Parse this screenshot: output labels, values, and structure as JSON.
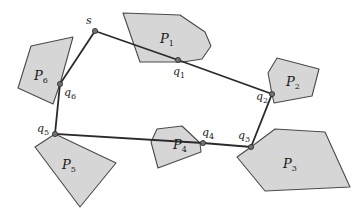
{
  "figure": {
    "colors": {
      "polygon_fill": "#d6d6d6",
      "polygon_stroke": "#4a4a4a",
      "path": "#2a2a2a",
      "point": "#707070"
    },
    "start": {
      "label": "s",
      "x": 95,
      "y": 31,
      "lx": 86,
      "ly": 24
    },
    "polygons": [
      {
        "name": "P",
        "sub": "1",
        "lx": 160,
        "ly": 43,
        "points": "123,13 180,15 205,32 211,46 202,59 183,62 140,62"
      },
      {
        "name": "P",
        "sub": "2",
        "lx": 286,
        "ly": 86,
        "points": "277,58 319,69 312,96 274,103 272,94 268,73"
      },
      {
        "name": "P",
        "sub": "3",
        "lx": 283,
        "ly": 168,
        "points": "275,129 325,132 350,187 265,191 237,157 251,147"
      },
      {
        "name": "P",
        "sub": "4",
        "lx": 173,
        "ly": 149,
        "points": "157,129 182,126 200,143 201,152 158,168 151,142"
      },
      {
        "name": "P",
        "sub": "5",
        "lx": 62,
        "ly": 169,
        "points": "55,134 116,163 80,207 35,147"
      },
      {
        "name": "P",
        "sub": "6",
        "lx": 34,
        "ly": 80,
        "points": "31,46 73,37 60,84 53,104 18,88"
      }
    ],
    "touch_points": [
      {
        "name": "q",
        "sub": "1",
        "x": 178,
        "y": 60,
        "lx": 173,
        "ly": 75
      },
      {
        "name": "q",
        "sub": "2",
        "x": 272,
        "y": 94,
        "lx": 256,
        "ly": 100
      },
      {
        "name": "q",
        "sub": "3",
        "x": 251,
        "y": 147,
        "lx": 238,
        "ly": 139
      },
      {
        "name": "q",
        "sub": "4",
        "x": 203,
        "y": 143,
        "lx": 202,
        "ly": 136
      },
      {
        "name": "q",
        "sub": "5",
        "x": 55,
        "y": 134,
        "lx": 37,
        "ly": 132
      },
      {
        "name": "q",
        "sub": "6",
        "x": 60,
        "y": 84,
        "lx": 64,
        "ly": 96
      }
    ],
    "path_order": [
      "s",
      "q1",
      "q2",
      "q3",
      "q4",
      "q5",
      "q6",
      "s"
    ],
    "path_points": "95,31 178,60 272,94 251,147 203,143 55,134 60,84 95,31"
  }
}
